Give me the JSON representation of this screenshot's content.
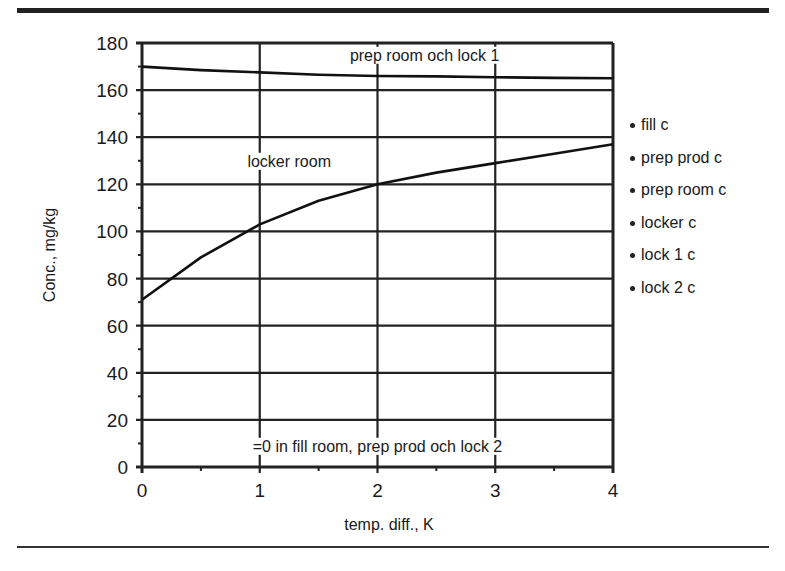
{
  "chart_data": {
    "type": "line",
    "title": "",
    "xlabel": "temp. diff., K",
    "ylabel": "Conc., mg/kg",
    "xlim": [
      0,
      4
    ],
    "ylim": [
      0,
      180
    ],
    "x_ticks": [
      "0",
      "1",
      "2",
      "3",
      "4"
    ],
    "y_ticks": [
      "0",
      "20",
      "40",
      "60",
      "80",
      "100",
      "120",
      "140",
      "160",
      "180"
    ],
    "grid": true,
    "legend_position": "right",
    "legend": [
      "fill c",
      "prep prod c",
      "prep room c",
      "locker c",
      "lock 1 c",
      "lock 2 c"
    ],
    "x": [
      0,
      0.5,
      1,
      1.5,
      2,
      2.5,
      3,
      3.5,
      4
    ],
    "series": [
      {
        "name": "prep room och lock 1",
        "values": [
          170,
          168.5,
          167.5,
          166.5,
          166,
          165.8,
          165.5,
          165.2,
          165
        ]
      },
      {
        "name": "locker room",
        "values": [
          71,
          89,
          103,
          113,
          120,
          125,
          129,
          133,
          137
        ]
      },
      {
        "name": "fill room, prep prod och lock 2",
        "values": [
          0,
          0,
          0,
          0,
          0,
          0,
          0,
          0,
          0
        ]
      }
    ],
    "annotations": [
      {
        "text": "prep room och lock 1",
        "x": 2.4,
        "y": 175
      },
      {
        "text": "locker room",
        "x": 1.25,
        "y": 130
      },
      {
        "text": "=0 in fill room, prep prod och lock 2",
        "x": 2.0,
        "y": 9
      }
    ]
  },
  "plot": {
    "left": 142,
    "right": 613,
    "top": 43,
    "bottom": 467
  }
}
